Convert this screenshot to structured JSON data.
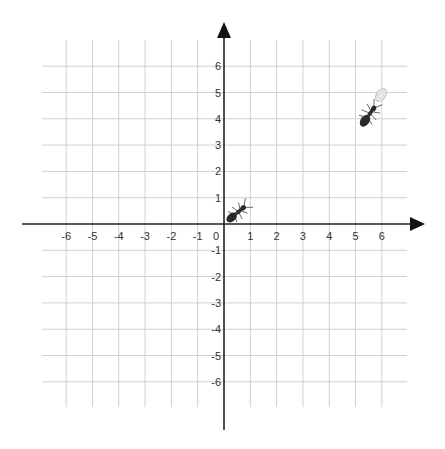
{
  "chart_data": {
    "type": "coordinate-plane",
    "title": "",
    "xlabel": "",
    "ylabel": "",
    "xlim": [
      -6,
      6
    ],
    "ylim": [
      -6,
      6
    ],
    "grid": true,
    "x_ticks": [
      "-6",
      "-5",
      "-4",
      "-3",
      "-2",
      "-1",
      "0",
      "1",
      "2",
      "3",
      "4",
      "5",
      "6"
    ],
    "y_ticks": [
      "6",
      "5",
      "4",
      "3",
      "2",
      "1",
      "-1",
      "-2",
      "-3",
      "-4",
      "-5",
      "-6"
    ],
    "objects": [
      {
        "name": "ant-1",
        "x": 0.5,
        "y": 0.5,
        "heading": "up-right",
        "note": "ant near origin"
      },
      {
        "name": "ant-2",
        "x": 5.5,
        "y": 4.3,
        "heading": "up-right",
        "note": "ant carrying food"
      },
      {
        "name": "food",
        "x": 6.0,
        "y": 5.0,
        "note": "light egg/crumb shape"
      }
    ]
  },
  "colors": {
    "grid": "#d0d0d0",
    "axis": "#222222",
    "ant": "#2a2a2a",
    "food": "#dddddd"
  },
  "labels": {
    "x": [
      {
        "text": "-6",
        "v": -6
      },
      {
        "text": "-5",
        "v": -5
      },
      {
        "text": "-4",
        "v": -4
      },
      {
        "text": "-3",
        "v": -3
      },
      {
        "text": "-2",
        "v": -2
      },
      {
        "text": "-1",
        "v": -1
      },
      {
        "text": "0",
        "v": 0
      },
      {
        "text": "1",
        "v": 1
      },
      {
        "text": "2",
        "v": 2
      },
      {
        "text": "3",
        "v": 3
      },
      {
        "text": "4",
        "v": 4
      },
      {
        "text": "5",
        "v": 5
      },
      {
        "text": "6",
        "v": 6
      }
    ],
    "y": [
      {
        "text": "6",
        "v": 6
      },
      {
        "text": "5",
        "v": 5
      },
      {
        "text": "4",
        "v": 4
      },
      {
        "text": "3",
        "v": 3
      },
      {
        "text": "2",
        "v": 2
      },
      {
        "text": "1",
        "v": 1
      },
      {
        "text": "-1",
        "v": -1
      },
      {
        "text": "-2",
        "v": -2
      },
      {
        "text": "-3",
        "v": -3
      },
      {
        "text": "-4",
        "v": -4
      },
      {
        "text": "-5",
        "v": -5
      },
      {
        "text": "-6",
        "v": -6
      }
    ]
  }
}
